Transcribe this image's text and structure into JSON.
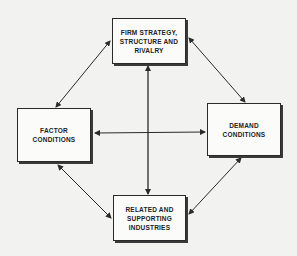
{
  "diagram": {
    "nodes": {
      "top": {
        "lines": [
          "FIRM STRATEGY,",
          "STRUCTURE AND",
          "RIVALRY"
        ]
      },
      "left": {
        "lines": [
          "FACTOR",
          "CONDITIONS"
        ]
      },
      "right": {
        "lines": [
          "DEMAND",
          "CONDITIONS"
        ]
      },
      "bottom": {
        "lines": [
          "RELATED AND",
          "SUPPORTING",
          "INDUSTRIES"
        ]
      }
    },
    "edges": [
      {
        "from": "top",
        "to": "left",
        "type": "bidirectional"
      },
      {
        "from": "top",
        "to": "right",
        "type": "bidirectional"
      },
      {
        "from": "left",
        "to": "bottom",
        "type": "bidirectional"
      },
      {
        "from": "right",
        "to": "bottom",
        "type": "bidirectional"
      },
      {
        "from": "top",
        "to": "bottom",
        "type": "bidirectional"
      },
      {
        "from": "left",
        "to": "right",
        "type": "bidirectional"
      }
    ],
    "colors": {
      "line": "#2a2a2a",
      "background": "#f2f2f0",
      "box_fill": "#fbfbfa"
    }
  }
}
